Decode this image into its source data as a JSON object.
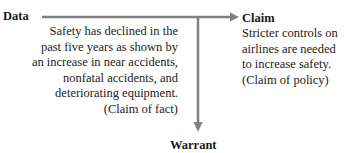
{
  "diagram": {
    "nodes": {
      "data": {
        "label": "Data",
        "lines": [
          "Safety has declined in the",
          "past five years as shown by",
          "an increase in near accidents,",
          "nonfatal accidents, and",
          "deteriorating equipment.",
          "(Claim of fact)"
        ]
      },
      "claim": {
        "label": "Claim",
        "lines": [
          "Stricter controls on",
          "airlines are needed",
          "to increase safety.",
          "(Claim of policy)"
        ]
      },
      "warrant": {
        "label": "Warrant"
      }
    },
    "edges": [
      {
        "from": "data",
        "to": "claim",
        "direction": "right"
      },
      {
        "from": "data-claim-line",
        "to": "warrant",
        "direction": "down"
      }
    ],
    "colors": {
      "arrow": "#808080",
      "text": "#1a1a1a"
    }
  }
}
